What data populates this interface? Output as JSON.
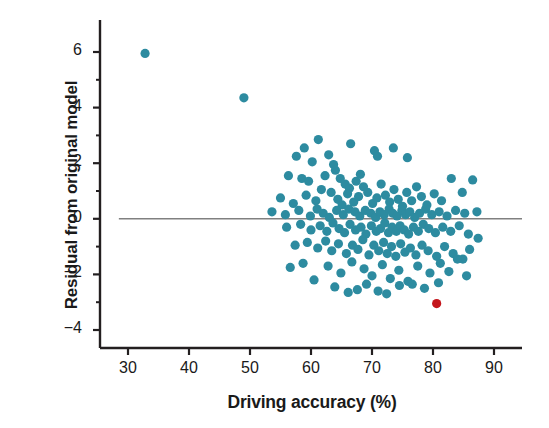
{
  "chart_data": {
    "type": "scatter",
    "title": "",
    "xlabel": "Driving accuracy (%)",
    "ylabel": "Residual from original model",
    "xlim": [
      27,
      95
    ],
    "ylim": [
      -4.6,
      6.9
    ],
    "xticks": [
      30,
      40,
      50,
      60,
      70,
      80,
      90
    ],
    "yticks": [
      6,
      4,
      2,
      0,
      -2,
      -4
    ],
    "xtick_labels": [
      "30",
      "40",
      "50",
      "60",
      "70",
      "80",
      "90"
    ],
    "ytick_labels": [
      "6",
      "4",
      "2",
      "0",
      "−2",
      "−4"
    ],
    "grid": false,
    "legend": null,
    "reference_line": {
      "orientation": "horizontal",
      "y": 0,
      "color": "#808080",
      "x_start": 28.5,
      "x_end": 97
    },
    "marker": {
      "shape": "circle",
      "radius": 4.6
    },
    "series": [
      {
        "name": "players",
        "color": "#2d8ba0",
        "points": [
          [
            32.8,
            5.95
          ],
          [
            49.0,
            4.35
          ],
          [
            58.9,
            2.55
          ],
          [
            61.2,
            2.85
          ],
          [
            62.9,
            2.3
          ],
          [
            60.2,
            2.05
          ],
          [
            63.7,
            1.95
          ],
          [
            57.6,
            2.25
          ],
          [
            66.5,
            2.7
          ],
          [
            70.4,
            2.45
          ],
          [
            70.9,
            2.25
          ],
          [
            73.5,
            2.55
          ],
          [
            75.8,
            2.2
          ],
          [
            56.3,
            1.55
          ],
          [
            58.5,
            1.45
          ],
          [
            59.6,
            1.35
          ],
          [
            62.3,
            1.55
          ],
          [
            64.0,
            1.75
          ],
          [
            64.8,
            1.45
          ],
          [
            65.6,
            1.25
          ],
          [
            66.3,
            1.1
          ],
          [
            67.4,
            1.35
          ],
          [
            68.1,
            1.6
          ],
          [
            55.0,
            0.75
          ],
          [
            57.1,
            0.55
          ],
          [
            59.2,
            0.85
          ],
          [
            60.8,
            0.65
          ],
          [
            61.7,
            1.05
          ],
          [
            63.3,
            0.95
          ],
          [
            64.4,
            0.7
          ],
          [
            65.1,
            0.5
          ],
          [
            66.0,
            0.9
          ],
          [
            67.0,
            0.6
          ],
          [
            67.8,
            0.8
          ],
          [
            68.6,
            1.15
          ],
          [
            69.3,
            0.95
          ],
          [
            70.1,
            0.55
          ],
          [
            70.8,
            0.75
          ],
          [
            71.5,
            1.25
          ],
          [
            72.2,
            0.85
          ],
          [
            72.9,
            0.6
          ],
          [
            73.6,
            1.05
          ],
          [
            74.3,
            0.7
          ],
          [
            75.0,
            0.45
          ],
          [
            75.7,
            0.95
          ],
          [
            76.5,
            0.65
          ],
          [
            77.3,
            1.15
          ],
          [
            78.1,
            0.8
          ],
          [
            79.0,
            0.5
          ],
          [
            80.2,
            0.9
          ],
          [
            81.4,
            0.65
          ],
          [
            83.0,
            1.45
          ],
          [
            84.8,
            0.95
          ],
          [
            86.5,
            1.4
          ],
          [
            53.6,
            0.25
          ],
          [
            55.8,
            0.15
          ],
          [
            58.0,
            0.3
          ],
          [
            59.9,
            0.1
          ],
          [
            61.0,
            0.35
          ],
          [
            62.0,
            0.2
          ],
          [
            63.0,
            0.05
          ],
          [
            64.2,
            0.3
          ],
          [
            65.3,
            0.15
          ],
          [
            66.2,
            0.35
          ],
          [
            67.2,
            0.25
          ],
          [
            68.0,
            0.1
          ],
          [
            68.9,
            0.3
          ],
          [
            69.8,
            0.2
          ],
          [
            70.6,
            0.05
          ],
          [
            71.3,
            0.25
          ],
          [
            72.0,
            0.15
          ],
          [
            72.8,
            0.35
          ],
          [
            73.4,
            0.2
          ],
          [
            74.1,
            0.1
          ],
          [
            74.9,
            0.3
          ],
          [
            75.5,
            0.15
          ],
          [
            76.2,
            0.25
          ],
          [
            77.0,
            0.05
          ],
          [
            77.8,
            0.2
          ],
          [
            78.8,
            0.35
          ],
          [
            79.8,
            0.15
          ],
          [
            81.0,
            0.25
          ],
          [
            82.3,
            0.1
          ],
          [
            83.7,
            0.3
          ],
          [
            85.2,
            0.2
          ],
          [
            87.2,
            0.25
          ],
          [
            56.0,
            -0.3
          ],
          [
            58.3,
            -0.2
          ],
          [
            60.0,
            -0.4
          ],
          [
            61.5,
            -0.25
          ],
          [
            62.6,
            -0.45
          ],
          [
            63.6,
            -0.15
          ],
          [
            64.6,
            -0.35
          ],
          [
            65.5,
            -0.5
          ],
          [
            66.4,
            -0.2
          ],
          [
            67.3,
            -0.4
          ],
          [
            68.2,
            -0.3
          ],
          [
            69.0,
            -0.55
          ],
          [
            69.9,
            -0.25
          ],
          [
            70.7,
            -0.45
          ],
          [
            71.4,
            -0.35
          ],
          [
            72.1,
            -0.15
          ],
          [
            72.7,
            -0.5
          ],
          [
            73.3,
            -0.3
          ],
          [
            74.0,
            -0.45
          ],
          [
            74.6,
            -0.25
          ],
          [
            75.3,
            -0.4
          ],
          [
            76.0,
            -0.55
          ],
          [
            76.8,
            -0.3
          ],
          [
            77.6,
            -0.45
          ],
          [
            78.4,
            -0.2
          ],
          [
            79.3,
            -0.35
          ],
          [
            80.4,
            -0.5
          ],
          [
            81.6,
            -0.3
          ],
          [
            82.9,
            -0.45
          ],
          [
            84.3,
            -0.25
          ],
          [
            85.8,
            -0.55
          ],
          [
            87.4,
            -0.7
          ],
          [
            57.4,
            -0.95
          ],
          [
            59.4,
            -0.85
          ],
          [
            61.1,
            -1.05
          ],
          [
            62.4,
            -0.8
          ],
          [
            63.4,
            -1.15
          ],
          [
            64.5,
            -0.9
          ],
          [
            65.8,
            -1.25
          ],
          [
            66.8,
            -0.95
          ],
          [
            67.7,
            -1.1
          ],
          [
            68.5,
            -0.75
          ],
          [
            69.5,
            -1.3
          ],
          [
            70.3,
            -0.95
          ],
          [
            71.1,
            -1.15
          ],
          [
            71.9,
            -0.85
          ],
          [
            72.5,
            -1.25
          ],
          [
            73.2,
            -1.0
          ],
          [
            73.9,
            -1.35
          ],
          [
            74.7,
            -0.9
          ],
          [
            75.4,
            -1.2
          ],
          [
            76.3,
            -1.05
          ],
          [
            77.2,
            -1.3
          ],
          [
            78.2,
            -0.95
          ],
          [
            79.2,
            -1.15
          ],
          [
            80.6,
            -1.35
          ],
          [
            81.9,
            -1.0
          ],
          [
            83.3,
            -1.25
          ],
          [
            84.9,
            -1.45
          ],
          [
            86.0,
            -1.1
          ],
          [
            56.6,
            -1.75
          ],
          [
            58.7,
            -1.6
          ],
          [
            60.5,
            -2.2
          ],
          [
            62.8,
            -1.7
          ],
          [
            64.9,
            -1.95
          ],
          [
            66.7,
            -1.55
          ],
          [
            68.7,
            -1.8
          ],
          [
            70.0,
            -2.05
          ],
          [
            71.7,
            -1.65
          ],
          [
            73.0,
            -2.15
          ],
          [
            74.4,
            -1.85
          ],
          [
            75.9,
            -2.25
          ],
          [
            77.5,
            -1.7
          ],
          [
            79.5,
            -1.95
          ],
          [
            81.2,
            -1.6
          ],
          [
            82.6,
            -1.9
          ],
          [
            84.0,
            -1.45
          ],
          [
            85.5,
            -2.05
          ],
          [
            63.9,
            -2.45
          ],
          [
            67.6,
            -2.55
          ],
          [
            69.1,
            -2.35
          ],
          [
            71.0,
            -2.6
          ],
          [
            74.5,
            -2.4
          ],
          [
            78.6,
            -2.5
          ],
          [
            80.9,
            -2.3
          ],
          [
            66.1,
            -2.65
          ],
          [
            72.4,
            -2.7
          ],
          [
            76.6,
            -2.35
          ]
        ]
      },
      {
        "name": "highlighted-player",
        "color": "#c4161c",
        "points": [
          [
            80.6,
            -3.05
          ]
        ]
      }
    ]
  },
  "axes": {
    "spine_color": "#231f20",
    "tick_color": "#231f20"
  }
}
